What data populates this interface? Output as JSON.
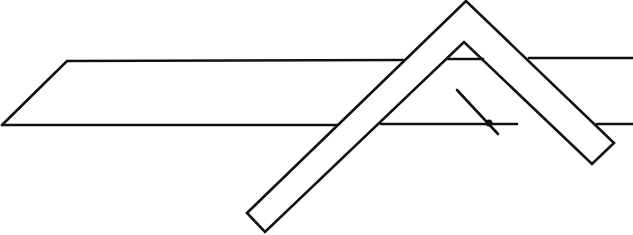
{
  "diagram": {
    "colors": {
      "line": "#111111",
      "background": "#ffffff"
    },
    "plane": {
      "top_edge": {
        "y": 60,
        "x_start": 67,
        "x_end": 633
      },
      "bottom_edge": {
        "y": 124,
        "x_start": 2,
        "x_end": 633
      },
      "left_slant": [
        [
          2,
          125
        ],
        [
          67,
          61
        ]
      ]
    },
    "bent_bar": {
      "outer_apex": [
        466,
        1
      ],
      "inner_apex": [
        464,
        42
      ],
      "left_end": [
        [
          247,
          213
        ],
        [
          265,
          232
        ]
      ],
      "right_end": [
        [
          614,
          143
        ],
        [
          592,
          164
        ]
      ]
    },
    "arrow_marker": {
      "from": [
        457,
        90
      ],
      "to": [
        498,
        134
      ],
      "dot": [
        489,
        123
      ]
    }
  }
}
